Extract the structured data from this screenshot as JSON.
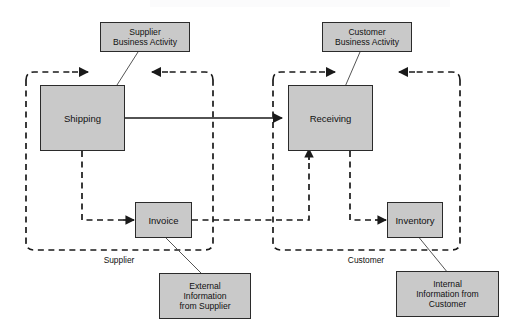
{
  "diagram": {
    "type": "flow-diagram",
    "colors": {
      "box_fill": "#c9c9c9",
      "box_stroke": "#2b2b2b",
      "line": "#1a1a1a",
      "background": "#ffffff",
      "leader_line": "#555555"
    },
    "zones": [
      {
        "id": "supplier",
        "label": "Supplier"
      },
      {
        "id": "customer",
        "label": "Customer"
      }
    ],
    "process_boxes": [
      {
        "id": "shipping",
        "label": "Shipping"
      },
      {
        "id": "receiving",
        "label": "Receiving"
      },
      {
        "id": "invoice",
        "label": "Invoice"
      },
      {
        "id": "inventory",
        "label": "Inventory"
      }
    ],
    "callouts": [
      {
        "id": "supplier-business-activity",
        "label": "Supplier\nBusiness Activity",
        "points_to": "shipping"
      },
      {
        "id": "customer-business-activity",
        "label": "Customer\nBusiness Activity",
        "points_to": "receiving"
      },
      {
        "id": "external-information-from-supplier",
        "label": "External\nInformation\nfrom Supplier",
        "points_to": "invoice"
      },
      {
        "id": "internal-information-from-customer",
        "label": "Internal\nInformation from\nCustomer",
        "points_to": "inventory"
      }
    ],
    "connectors": [
      {
        "id": "shipping-to-receiving",
        "style": "solid",
        "from": "shipping",
        "to": "receiving"
      },
      {
        "id": "shipping-to-invoice",
        "style": "dashed",
        "from": "shipping",
        "to": "invoice"
      },
      {
        "id": "invoice-to-receiving",
        "style": "dashed",
        "from": "invoice",
        "to": "receiving"
      },
      {
        "id": "receiving-to-inventory",
        "style": "dashed",
        "from": "receiving",
        "to": "inventory"
      },
      {
        "id": "supplier-zone-loop",
        "style": "dashed",
        "from": "supplier",
        "to": "supplier"
      },
      {
        "id": "customer-zone-loop",
        "style": "dashed",
        "from": "customer",
        "to": "customer"
      }
    ]
  }
}
